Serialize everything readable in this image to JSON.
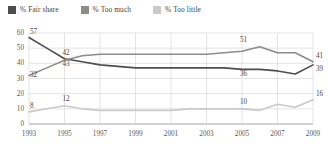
{
  "chart_data": {
    "type": "line",
    "title": "",
    "xlabel": "",
    "ylabel": "",
    "ylim": [
      0,
      60
    ],
    "ytick_step": 10,
    "yticks": [
      "0",
      "10",
      "20",
      "30",
      "40",
      "50",
      "60"
    ],
    "grid": true,
    "legend_position": "top-left",
    "x": [
      1993,
      1994,
      1995,
      1996,
      1997,
      1998,
      1999,
      2000,
      2001,
      2002,
      2003,
      2004,
      2005,
      2006,
      2007,
      2008,
      2009
    ],
    "xticks": [
      "1993",
      "1995",
      "1997",
      "1999",
      "2001",
      "2003",
      "2005",
      "2007",
      "2009"
    ],
    "series": [
      {
        "name": "% Fair share",
        "color": "#4d4d4d",
        "values": [
          57,
          50,
          43,
          41,
          39,
          38,
          37,
          37,
          37,
          37,
          37,
          37,
          36,
          36,
          35,
          33,
          39
        ],
        "labels": [
          {
            "x": 1993,
            "value": 57
          },
          {
            "x": 1995,
            "value": 43
          },
          {
            "x": 2005,
            "value": 36
          },
          {
            "x": 2009,
            "value": 39
          }
        ]
      },
      {
        "name": "% Too much",
        "color": "#8c8c8c",
        "values": [
          32,
          37,
          42,
          45,
          46,
          46,
          46,
          46,
          46,
          46,
          46,
          47,
          48,
          51,
          47,
          47,
          41
        ],
        "labels": [
          {
            "x": 1993,
            "value": 32
          },
          {
            "x": 1995,
            "value": 42
          },
          {
            "x": 2005,
            "value": 51
          },
          {
            "x": 2009,
            "value": 41
          }
        ]
      },
      {
        "name": "% Too little",
        "color": "#c9c9c9",
        "values": [
          8,
          10,
          12,
          10,
          9,
          9,
          9,
          9,
          9,
          10,
          10,
          10,
          10,
          9,
          13,
          11,
          16
        ],
        "labels": [
          {
            "x": 1993,
            "value": 8
          },
          {
            "x": 1995,
            "value": 12
          },
          {
            "x": 2005,
            "value": 10
          },
          {
            "x": 2009,
            "value": 16
          }
        ]
      }
    ]
  },
  "legend": {
    "items": [
      {
        "label": "% Fair share",
        "color": "#4d4d4d"
      },
      {
        "label": "% Too much",
        "color": "#8c8c8c"
      },
      {
        "label": "% Too little",
        "color": "#c9c9c9"
      }
    ]
  }
}
